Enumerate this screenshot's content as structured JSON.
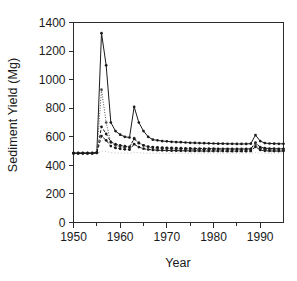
{
  "chart_data": {
    "type": "line",
    "title": "",
    "xlabel": "Year",
    "ylabel": "Sediment Yield (Mg)",
    "xlim": [
      1950,
      1995
    ],
    "ylim": [
      0,
      1400
    ],
    "xticks": [
      1950,
      1960,
      1970,
      1980,
      1990
    ],
    "yticks": [
      0,
      200,
      400,
      600,
      800,
      1000,
      1200,
      1400
    ],
    "xtick_labels": [
      "1950",
      "1960",
      "1970",
      "1980",
      "1990"
    ],
    "ytick_labels": [
      "0",
      "200",
      "400",
      "600",
      "800",
      "1000",
      "1200",
      "1400"
    ],
    "minor_xtick_interval": 5,
    "grid": false,
    "legend": "none",
    "x": [
      1950,
      1951,
      1952,
      1953,
      1954,
      1955,
      1956,
      1957,
      1958,
      1959,
      1960,
      1961,
      1962,
      1963,
      1964,
      1965,
      1966,
      1967,
      1968,
      1969,
      1970,
      1971,
      1972,
      1973,
      1974,
      1975,
      1976,
      1977,
      1978,
      1979,
      1980,
      1981,
      1982,
      1983,
      1984,
      1985,
      1986,
      1987,
      1988,
      1989,
      1990,
      1991,
      1992,
      1993,
      1994,
      1995
    ],
    "series": [
      {
        "name": "series-1-solid-markers",
        "style": "solid",
        "marker": "filled-circle",
        "color": "#1a1a1a",
        "values": [
          485,
          485,
          485,
          485,
          485,
          490,
          1325,
          1100,
          700,
          640,
          615,
          600,
          595,
          810,
          700,
          640,
          600,
          580,
          575,
          570,
          568,
          565,
          563,
          562,
          560,
          558,
          557,
          556,
          555,
          554,
          553,
          552,
          552,
          551,
          551,
          550,
          550,
          550,
          552,
          612,
          570,
          556,
          553,
          552,
          551,
          551
        ]
      },
      {
        "name": "series-2-dotted",
        "style": "dotted",
        "marker": "filled-circle",
        "color": "#4a4a4a",
        "values": [
          485,
          485,
          485,
          485,
          485,
          488,
          930,
          700,
          560,
          540,
          530,
          525,
          522,
          590,
          560,
          540,
          528,
          522,
          520,
          518,
          517,
          516,
          515,
          514,
          513,
          512,
          512,
          511,
          511,
          510,
          510,
          509,
          509,
          509,
          508,
          508,
          508,
          508,
          509,
          545,
          520,
          512,
          510,
          509,
          509,
          508
        ]
      },
      {
        "name": "series-3-dashed-upper",
        "style": "dashed",
        "marker": "filled-circle",
        "color": "#1a1a1a",
        "values": [
          485,
          485,
          485,
          485,
          485,
          489,
          670,
          620,
          565,
          548,
          540,
          534,
          530,
          585,
          555,
          540,
          532,
          528,
          526,
          524,
          523,
          522,
          521,
          520,
          519,
          519,
          518,
          518,
          517,
          517,
          517,
          516,
          516,
          516,
          515,
          515,
          515,
          515,
          516,
          560,
          528,
          520,
          518,
          517,
          516,
          516
        ]
      },
      {
        "name": "series-4-dashed-lower",
        "style": "dashed",
        "marker": "filled-circle",
        "color": "#1a1a1a",
        "values": [
          485,
          485,
          485,
          485,
          485,
          487,
          605,
          575,
          535,
          522,
          516,
          512,
          510,
          548,
          528,
          517,
          511,
          508,
          506,
          505,
          504,
          503,
          503,
          502,
          502,
          501,
          501,
          501,
          500,
          500,
          500,
          500,
          500,
          499,
          499,
          499,
          499,
          499,
          500,
          530,
          508,
          502,
          501,
          500,
          500,
          500
        ]
      },
      {
        "name": "series-5-baseline",
        "style": "dotted-light",
        "marker": "none",
        "color": "#b0b0b0",
        "values": [
          485,
          485,
          485,
          485,
          485,
          485,
          500,
          497,
          490,
          487,
          486,
          486,
          485,
          492,
          488,
          486,
          485,
          485,
          485,
          485,
          485,
          485,
          485,
          485,
          485,
          485,
          485,
          485,
          485,
          485,
          485,
          485,
          485,
          485,
          485,
          485,
          485,
          485,
          485,
          490,
          486,
          485,
          485,
          485,
          485,
          485
        ]
      }
    ]
  },
  "axes": {
    "ylabel": "Sediment Yield (Mg)",
    "xlabel": "Year"
  }
}
